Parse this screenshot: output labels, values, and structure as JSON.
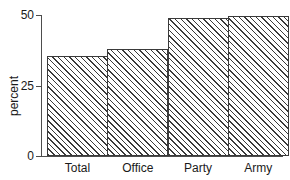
{
  "chart_data": {
    "type": "bar",
    "title": "",
    "xlabel": "",
    "ylabel": "percent",
    "categories": [
      "Total",
      "Office",
      "Party",
      "Army"
    ],
    "values": [
      35.4,
      38.0,
      49.0,
      49.8
    ],
    "ylim": [
      0,
      50
    ],
    "yticks": [
      0,
      25,
      50
    ],
    "ytick_labels": [
      "0",
      "25",
      "50"
    ],
    "grid": false,
    "legend": false,
    "bar_fill": "hatched-diagonal",
    "colors": {
      "axis": "#4d4d4d",
      "bar_edge": "#3a3a3a",
      "hatch": "#3a3a3a",
      "text": "#1a1a1a",
      "background": "#ffffff"
    }
  }
}
